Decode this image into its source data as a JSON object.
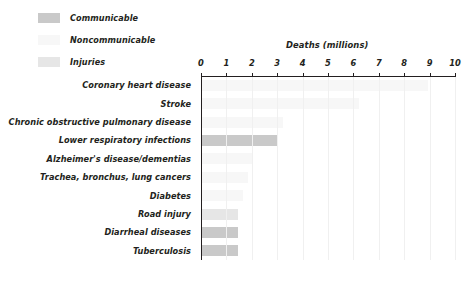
{
  "legend": {
    "items": [
      {
        "label": "Communicable",
        "color": "#c9c9c9"
      },
      {
        "label": "Noncommunicable",
        "color": "#f7f7f7"
      },
      {
        "label": "Injuries",
        "color": "#e6e6e6"
      }
    ]
  },
  "chart_data": {
    "type": "bar",
    "orientation": "horizontal",
    "title": "",
    "xlabel": "Deaths (millions)",
    "ylabel": "",
    "xlim": [
      0,
      10
    ],
    "xticks": [
      0,
      1,
      2,
      3,
      4,
      5,
      6,
      7,
      8,
      9,
      10
    ],
    "xticklabels": [
      "0",
      "1",
      "2",
      "3",
      "4",
      "5",
      "6",
      "7",
      "8",
      "9",
      "10"
    ],
    "grid": true,
    "legend_position": "top-left",
    "categories": [
      "Coronary heart disease",
      "Stroke",
      "Chronic obstructive pulmonary disease",
      "Lower respiratory infections",
      "Alzheimer's disease/dementias",
      "Trachea, bronchus, lung cancers",
      "Diabetes",
      "Road injury",
      "Diarrheal diseases",
      "Tuberculosis"
    ],
    "values": [
      8.9,
      6.2,
      3.2,
      3.0,
      2.0,
      1.8,
      1.6,
      1.4,
      1.4,
      1.4
    ],
    "groups": [
      "Noncommunicable",
      "Noncommunicable",
      "Noncommunicable",
      "Communicable",
      "Noncommunicable",
      "Noncommunicable",
      "Noncommunicable",
      "Injuries",
      "Communicable",
      "Communicable"
    ]
  }
}
